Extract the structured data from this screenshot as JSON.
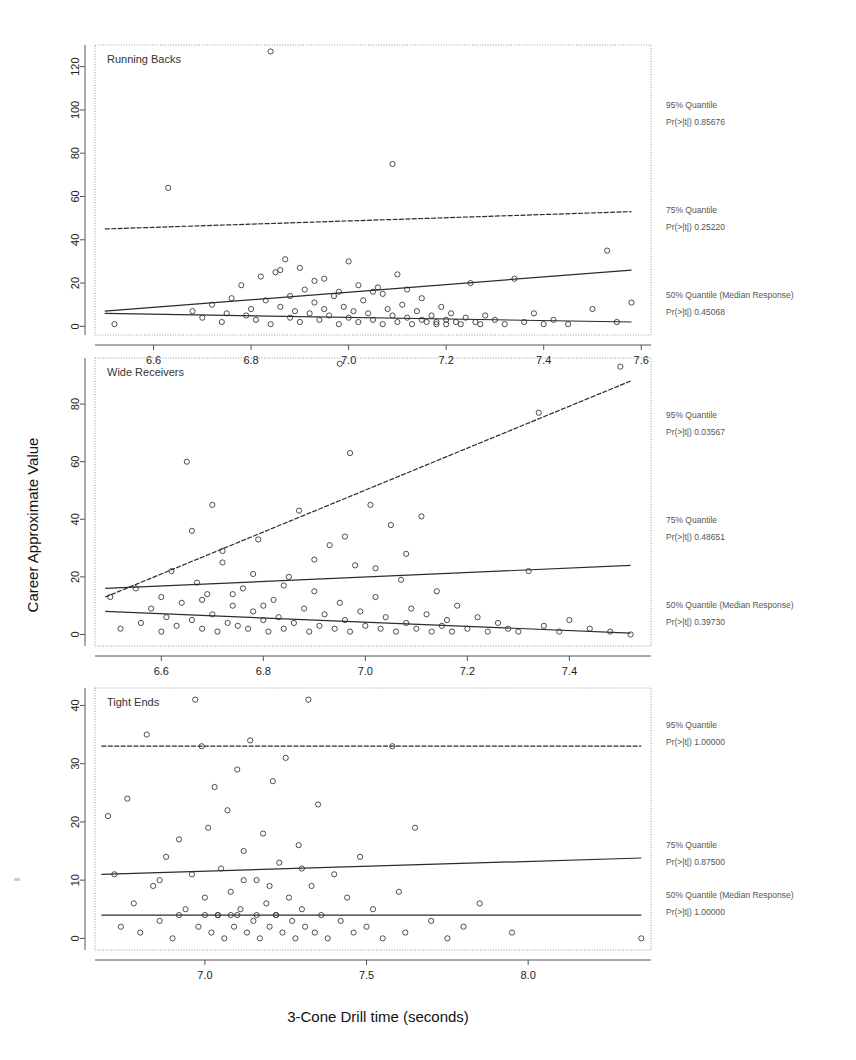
{
  "figure": {
    "xlabel": "3-Cone Drill time (seconds)",
    "ylabel": "Career Approximate Value"
  },
  "annotation_labels": {
    "q95": "95% Quantile",
    "q75": "75% Quantile",
    "q50": "50% Quantile (Median Response)",
    "p_prefix": "Pr(>|t|)"
  },
  "chart_data": [
    {
      "type": "scatter",
      "title": "Running Backs",
      "xlabel": "3-Cone Drill time (seconds)",
      "ylabel": "Career Approximate Value",
      "xlim": [
        6.48,
        7.62
      ],
      "ylim": [
        -4,
        130
      ],
      "xticks": [
        6.6,
        6.8,
        7.0,
        7.2,
        7.4,
        7.6
      ],
      "yticks": [
        0,
        20,
        40,
        60,
        80,
        100,
        120
      ],
      "grid": false,
      "legend": "right-side annotations",
      "annotations": [
        {
          "quantile": "95% Quantile",
          "p_label": "Pr(>|t|)",
          "p_value": "0.85676"
        },
        {
          "quantile": "75% Quantile",
          "p_label": "Pr(>|t|)",
          "p_value": "0.25220"
        },
        {
          "quantile": "50% Quantile (Median Response)",
          "p_label": "Pr(>|t|)",
          "p_value": "0.45068"
        }
      ],
      "fit_lines": [
        {
          "name": "95% Quantile",
          "x": [
            6.5,
            7.58
          ],
          "y": [
            45.0,
            53.0
          ]
        },
        {
          "name": "75% Quantile",
          "x": [
            6.5,
            7.58
          ],
          "y": [
            7.0,
            26.0
          ]
        },
        {
          "name": "50% Quantile (Median Response)",
          "x": [
            6.5,
            7.58
          ],
          "y": [
            6.0,
            2.0
          ]
        }
      ],
      "points": [
        [
          6.52,
          1
        ],
        [
          6.63,
          64
        ],
        [
          6.68,
          7
        ],
        [
          6.7,
          4
        ],
        [
          6.72,
          10
        ],
        [
          6.74,
          2
        ],
        [
          6.75,
          6
        ],
        [
          6.76,
          13
        ],
        [
          6.78,
          19
        ],
        [
          6.79,
          5
        ],
        [
          6.8,
          8
        ],
        [
          6.81,
          3
        ],
        [
          6.82,
          23
        ],
        [
          6.83,
          12
        ],
        [
          6.84,
          127
        ],
        [
          6.84,
          1
        ],
        [
          6.85,
          25
        ],
        [
          6.86,
          9
        ],
        [
          6.87,
          31
        ],
        [
          6.88,
          4
        ],
        [
          6.88,
          14
        ],
        [
          6.89,
          7
        ],
        [
          6.9,
          2
        ],
        [
          6.91,
          17
        ],
        [
          6.92,
          6
        ],
        [
          6.93,
          11
        ],
        [
          6.94,
          3
        ],
        [
          6.95,
          8
        ],
        [
          6.95,
          22
        ],
        [
          6.96,
          5
        ],
        [
          6.97,
          14
        ],
        [
          6.98,
          1
        ],
        [
          6.99,
          9
        ],
        [
          7.0,
          4
        ],
        [
          7.0,
          30
        ],
        [
          7.01,
          7
        ],
        [
          7.02,
          2
        ],
        [
          7.03,
          12
        ],
        [
          7.04,
          6
        ],
        [
          7.05,
          3
        ],
        [
          7.06,
          18
        ],
        [
          7.07,
          1
        ],
        [
          7.08,
          8
        ],
        [
          7.09,
          75
        ],
        [
          7.09,
          5
        ],
        [
          7.1,
          2
        ],
        [
          7.1,
          24
        ],
        [
          7.11,
          10
        ],
        [
          7.12,
          4
        ],
        [
          7.13,
          1
        ],
        [
          7.14,
          7
        ],
        [
          7.15,
          3
        ],
        [
          7.15,
          13
        ],
        [
          7.16,
          2
        ],
        [
          7.17,
          5
        ],
        [
          7.18,
          1
        ],
        [
          7.19,
          9
        ],
        [
          7.2,
          3
        ],
        [
          7.21,
          6
        ],
        [
          7.22,
          2
        ],
        [
          7.23,
          1
        ],
        [
          7.24,
          4
        ],
        [
          7.25,
          20
        ],
        [
          7.26,
          2
        ],
        [
          7.27,
          1
        ],
        [
          7.28,
          5
        ],
        [
          7.3,
          3
        ],
        [
          7.32,
          1
        ],
        [
          7.34,
          22
        ],
        [
          7.36,
          2
        ],
        [
          7.38,
          6
        ],
        [
          7.4,
          1
        ],
        [
          7.42,
          3
        ],
        [
          7.45,
          1
        ],
        [
          7.5,
          8
        ],
        [
          7.53,
          35
        ],
        [
          7.55,
          2
        ],
        [
          7.58,
          11
        ],
        [
          6.86,
          26
        ],
        [
          6.9,
          27
        ],
        [
          6.93,
          21
        ],
        [
          7.05,
          16
        ],
        [
          7.07,
          15
        ],
        [
          7.12,
          17
        ],
        [
          6.98,
          16
        ],
        [
          7.02,
          19
        ],
        [
          7.18,
          2
        ],
        [
          7.2,
          1
        ]
      ]
    },
    {
      "type": "scatter",
      "title": "Wide Receivers",
      "xlabel": "3-Cone Drill time (seconds)",
      "ylabel": "Career Approximate Value",
      "xlim": [
        6.47,
        7.56
      ],
      "ylim": [
        -4,
        96
      ],
      "xticks": [
        6.6,
        6.8,
        7.0,
        7.2,
        7.4
      ],
      "yticks": [
        0,
        20,
        40,
        60,
        80
      ],
      "grid": false,
      "legend": "right-side annotations",
      "annotations": [
        {
          "quantile": "95% Quantile",
          "p_label": "Pr(>|t|)",
          "p_value": "0.03567"
        },
        {
          "quantile": "75% Quantile",
          "p_label": "Pr(>|t|)",
          "p_value": "0.48651"
        },
        {
          "quantile": "50% Quantile (Median Response)",
          "p_label": "Pr(>|t|)",
          "p_value": "0.39730"
        }
      ],
      "fit_lines": [
        {
          "name": "95% Quantile",
          "x": [
            6.49,
            7.52
          ],
          "y": [
            13.0,
            88.0
          ]
        },
        {
          "name": "75% Quantile",
          "x": [
            6.49,
            7.52
          ],
          "y": [
            16.0,
            24.0
          ]
        },
        {
          "name": "50% Quantile (Median Response)",
          "x": [
            6.49,
            7.52
          ],
          "y": [
            8.0,
            0.5
          ]
        }
      ],
      "points": [
        [
          6.5,
          13
        ],
        [
          6.52,
          2
        ],
        [
          6.55,
          16
        ],
        [
          6.56,
          4
        ],
        [
          6.58,
          9
        ],
        [
          6.6,
          1
        ],
        [
          6.61,
          6
        ],
        [
          6.62,
          22
        ],
        [
          6.63,
          3
        ],
        [
          6.64,
          11
        ],
        [
          6.65,
          60
        ],
        [
          6.66,
          5
        ],
        [
          6.67,
          18
        ],
        [
          6.68,
          2
        ],
        [
          6.69,
          14
        ],
        [
          6.7,
          45
        ],
        [
          6.7,
          7
        ],
        [
          6.71,
          1
        ],
        [
          6.72,
          25
        ],
        [
          6.73,
          4
        ],
        [
          6.74,
          10
        ],
        [
          6.75,
          3
        ],
        [
          6.76,
          16
        ],
        [
          6.77,
          2
        ],
        [
          6.78,
          8
        ],
        [
          6.79,
          33
        ],
        [
          6.8,
          5
        ],
        [
          6.81,
          1
        ],
        [
          6.82,
          12
        ],
        [
          6.83,
          6
        ],
        [
          6.84,
          2
        ],
        [
          6.85,
          20
        ],
        [
          6.86,
          4
        ],
        [
          6.87,
          43
        ],
        [
          6.88,
          9
        ],
        [
          6.89,
          1
        ],
        [
          6.9,
          15
        ],
        [
          6.91,
          3
        ],
        [
          6.92,
          7
        ],
        [
          6.93,
          31
        ],
        [
          6.94,
          2
        ],
        [
          6.95,
          94
        ],
        [
          6.95,
          11
        ],
        [
          6.96,
          5
        ],
        [
          6.97,
          63
        ],
        [
          6.97,
          1
        ],
        [
          6.98,
          24
        ],
        [
          6.99,
          8
        ],
        [
          7.0,
          3
        ],
        [
          7.01,
          45
        ],
        [
          7.02,
          13
        ],
        [
          7.03,
          2
        ],
        [
          7.04,
          6
        ],
        [
          7.05,
          38
        ],
        [
          7.06,
          1
        ],
        [
          7.07,
          19
        ],
        [
          7.08,
          4
        ],
        [
          7.09,
          9
        ],
        [
          7.1,
          2
        ],
        [
          7.11,
          41
        ],
        [
          7.12,
          7
        ],
        [
          7.13,
          1
        ],
        [
          7.14,
          15
        ],
        [
          7.15,
          3
        ],
        [
          7.16,
          5
        ],
        [
          7.17,
          1
        ],
        [
          7.18,
          10
        ],
        [
          7.2,
          2
        ],
        [
          7.22,
          6
        ],
        [
          7.24,
          1
        ],
        [
          7.26,
          4
        ],
        [
          7.28,
          2
        ],
        [
          7.3,
          1
        ],
        [
          7.32,
          22
        ],
        [
          7.34,
          77
        ],
        [
          7.35,
          3
        ],
        [
          7.38,
          1
        ],
        [
          7.4,
          5
        ],
        [
          7.44,
          2
        ],
        [
          7.48,
          1
        ],
        [
          7.5,
          93
        ],
        [
          7.52,
          0
        ],
        [
          6.66,
          36
        ],
        [
          6.72,
          29
        ],
        [
          6.78,
          21
        ],
        [
          6.84,
          17
        ],
        [
          6.9,
          26
        ],
        [
          6.96,
          34
        ],
        [
          7.02,
          23
        ],
        [
          7.08,
          28
        ],
        [
          6.6,
          13
        ],
        [
          6.68,
          12
        ],
        [
          6.74,
          14
        ],
        [
          6.8,
          10
        ]
      ]
    },
    {
      "type": "scatter",
      "title": "Tight Ends",
      "xlabel": "3-Cone Drill time (seconds)",
      "ylabel": "Career Approximate Value",
      "xlim": [
        6.66,
        8.38
      ],
      "ylim": [
        -2,
        43
      ],
      "xticks": [
        7.0,
        7.5,
        8.0
      ],
      "yticks": [
        0,
        10,
        20,
        30,
        40
      ],
      "grid": false,
      "legend": "right-side annotations",
      "annotations": [
        {
          "quantile": "95% Quantile",
          "p_label": "Pr(>|t|)",
          "p_value": "1.00000"
        },
        {
          "quantile": "75% Quantile",
          "p_label": "Pr(>|t|)",
          "p_value": "0.87500"
        },
        {
          "quantile": "50% Quantile (Median Response)",
          "p_label": "Pr(>|t|)",
          "p_value": "1.00000"
        }
      ],
      "fit_lines": [
        {
          "name": "95% Quantile",
          "x": [
            6.68,
            8.35
          ],
          "y": [
            33.0,
            33.0
          ]
        },
        {
          "name": "75% Quantile",
          "x": [
            6.68,
            8.35
          ],
          "y": [
            11.0,
            13.8
          ]
        },
        {
          "name": "50% Quantile (Median Response)",
          "x": [
            6.68,
            8.35
          ],
          "y": [
            4.0,
            4.0
          ]
        }
      ],
      "points": [
        [
          6.7,
          21
        ],
        [
          6.72,
          11
        ],
        [
          6.74,
          2
        ],
        [
          6.76,
          24
        ],
        [
          6.78,
          6
        ],
        [
          6.8,
          1
        ],
        [
          6.82,
          35
        ],
        [
          6.84,
          9
        ],
        [
          6.86,
          3
        ],
        [
          6.88,
          14
        ],
        [
          6.9,
          0
        ],
        [
          6.92,
          17
        ],
        [
          6.94,
          5
        ],
        [
          6.96,
          11
        ],
        [
          6.97,
          41
        ],
        [
          6.98,
          2
        ],
        [
          6.99,
          33
        ],
        [
          7.0,
          7
        ],
        [
          7.01,
          19
        ],
        [
          7.02,
          1
        ],
        [
          7.03,
          26
        ],
        [
          7.04,
          4
        ],
        [
          7.05,
          12
        ],
        [
          7.06,
          0
        ],
        [
          7.07,
          22
        ],
        [
          7.08,
          8
        ],
        [
          7.09,
          2
        ],
        [
          7.1,
          29
        ],
        [
          7.11,
          5
        ],
        [
          7.12,
          15
        ],
        [
          7.13,
          1
        ],
        [
          7.14,
          34
        ],
        [
          7.15,
          3
        ],
        [
          7.16,
          10
        ],
        [
          7.17,
          0
        ],
        [
          7.18,
          18
        ],
        [
          7.19,
          6
        ],
        [
          7.2,
          2
        ],
        [
          7.21,
          27
        ],
        [
          7.22,
          4
        ],
        [
          7.23,
          13
        ],
        [
          7.24,
          1
        ],
        [
          7.25,
          31
        ],
        [
          7.26,
          7
        ],
        [
          7.27,
          3
        ],
        [
          7.28,
          0
        ],
        [
          7.29,
          16
        ],
        [
          7.3,
          5
        ],
        [
          7.31,
          2
        ],
        [
          7.32,
          41
        ],
        [
          7.33,
          9
        ],
        [
          7.34,
          1
        ],
        [
          7.35,
          23
        ],
        [
          7.36,
          4
        ],
        [
          7.38,
          0
        ],
        [
          7.4,
          11
        ],
        [
          7.42,
          3
        ],
        [
          7.44,
          7
        ],
        [
          7.46,
          1
        ],
        [
          7.48,
          14
        ],
        [
          7.5,
          2
        ],
        [
          7.52,
          5
        ],
        [
          7.55,
          0
        ],
        [
          7.58,
          33
        ],
        [
          7.6,
          8
        ],
        [
          7.62,
          1
        ],
        [
          7.65,
          19
        ],
        [
          7.7,
          3
        ],
        [
          7.75,
          0
        ],
        [
          7.8,
          2
        ],
        [
          7.85,
          6
        ],
        [
          7.95,
          1
        ],
        [
          8.35,
          0
        ],
        [
          6.92,
          4
        ],
        [
          7.04,
          4
        ],
        [
          7.1,
          4
        ],
        [
          7.16,
          4
        ],
        [
          7.22,
          4
        ],
        [
          7.0,
          4
        ],
        [
          7.08,
          4
        ],
        [
          6.86,
          10
        ],
        [
          7.12,
          10
        ],
        [
          7.2,
          9
        ],
        [
          7.3,
          12
        ]
      ]
    }
  ]
}
